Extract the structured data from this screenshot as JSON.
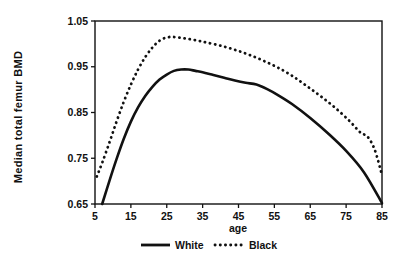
{
  "chart_data": {
    "type": "line",
    "title": "",
    "xlabel": "age",
    "ylabel": "Median total femur BMD",
    "xlim": [
      5,
      85
    ],
    "ylim": [
      0.65,
      1.05
    ],
    "xticks": [
      5,
      15,
      25,
      35,
      45,
      55,
      65,
      75,
      85
    ],
    "xtick_labels": [
      "5",
      "15",
      "25",
      "35",
      "45",
      "55",
      "65",
      "75",
      "85"
    ],
    "yticks": [
      0.65,
      0.75,
      0.85,
      0.95,
      1.05
    ],
    "ytick_labels": [
      "0.65",
      "0.75",
      "0.85",
      "0.95",
      "1.05"
    ],
    "grid": false,
    "legend_position": "below-axes",
    "frame": "box",
    "series": [
      {
        "name": "White",
        "style": "solid",
        "color": "#111111",
        "x": [
          7.0,
          9.0,
          11.0,
          13.0,
          15.0,
          17.0,
          19.0,
          21.0,
          23.0,
          25.0,
          27.0,
          29.0,
          31.0,
          33.0,
          35.0,
          38.0,
          41.0,
          44.0,
          47.0,
          50.0,
          53.0,
          56.0,
          60.0,
          65.0,
          70.0,
          75.0,
          80.0,
          85.0
        ],
        "y": [
          0.65,
          0.7,
          0.748,
          0.792,
          0.83,
          0.861,
          0.886,
          0.906,
          0.922,
          0.933,
          0.941,
          0.944,
          0.944,
          0.941,
          0.938,
          0.932,
          0.926,
          0.92,
          0.915,
          0.911,
          0.901,
          0.888,
          0.868,
          0.838,
          0.804,
          0.766,
          0.719,
          0.652
        ]
      },
      {
        "name": "Black",
        "style": "dotted",
        "color": "#111111",
        "x": [
          5.5,
          7.0,
          9.0,
          11.0,
          13.0,
          15.0,
          17.0,
          19.0,
          21.0,
          23.0,
          25.0,
          27.0,
          30.0,
          33.0,
          36.0,
          40.0,
          44.0,
          48.0,
          52.0,
          56.0,
          60.0,
          64.0,
          68.0,
          72.0,
          76.0,
          79.0,
          81.0,
          83.0,
          85.0
        ],
        "y": [
          0.71,
          0.74,
          0.784,
          0.83,
          0.873,
          0.911,
          0.944,
          0.971,
          0.992,
          1.007,
          1.014,
          1.015,
          1.012,
          1.008,
          1.003,
          0.996,
          0.987,
          0.976,
          0.963,
          0.948,
          0.93,
          0.908,
          0.885,
          0.86,
          0.831,
          0.806,
          0.797,
          0.768,
          0.713
        ]
      }
    ],
    "legend": [
      {
        "label": "White",
        "style": "solid"
      },
      {
        "label": "Black",
        "style": "dotted"
      }
    ]
  }
}
